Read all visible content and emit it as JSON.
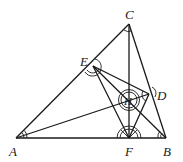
{
  "diagram": {
    "type": "geometry",
    "points": {
      "A": {
        "label": "A",
        "x": 16,
        "y": 138
      },
      "B": {
        "label": "B",
        "x": 166,
        "y": 138
      },
      "C": {
        "label": "C",
        "x": 129,
        "y": 24
      },
      "D": {
        "label": "D",
        "x": 149,
        "y": 94
      },
      "E": {
        "label": "E",
        "x": 93,
        "y": 66
      },
      "F": {
        "label": "F",
        "x": 129,
        "y": 138
      },
      "H": {
        "label": "H",
        "x": 129,
        "y": 100
      }
    },
    "segments": [
      [
        "A",
        "B"
      ],
      [
        "B",
        "C"
      ],
      [
        "C",
        "A"
      ],
      [
        "C",
        "F"
      ],
      [
        "A",
        "D"
      ],
      [
        "B",
        "E"
      ],
      [
        "E",
        "F"
      ],
      [
        "E",
        "D"
      ],
      [
        "D",
        "F"
      ],
      [
        "E",
        "H"
      ]
    ],
    "angle_marks": [
      "A",
      "B",
      "C",
      "D",
      "E",
      "F",
      "H"
    ]
  }
}
